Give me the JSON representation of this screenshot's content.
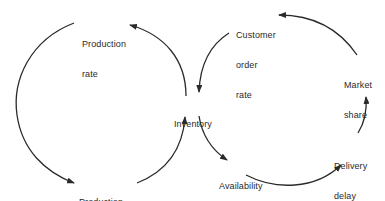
{
  "diagram": {
    "type": "causal-loop",
    "colors": {
      "line": "#2a2a2a",
      "text": "#2a2a2a",
      "background": "#ffffff"
    },
    "nodes": {
      "production_rate": {
        "lines": [
          "Production",
          "rate"
        ]
      },
      "production_completions": {
        "lines": [
          "Production",
          "completions"
        ]
      },
      "inventory": {
        "lines": [
          "Inventory"
        ]
      },
      "customer_order_rate": {
        "lines": [
          "Customer",
          "order",
          "rate"
        ]
      },
      "market_share": {
        "lines": [
          "Market",
          "share"
        ]
      },
      "delivery_delay": {
        "lines": [
          "Delivery",
          "delay"
        ]
      },
      "availability": {
        "lines": [
          "Availability"
        ]
      }
    },
    "edges": [
      {
        "from": "Inventory",
        "to": "Production rate"
      },
      {
        "from": "Production rate",
        "to": "Production completions"
      },
      {
        "from": "Production completions",
        "to": "Inventory"
      },
      {
        "from": "Inventory",
        "to": "Availability"
      },
      {
        "from": "Availability",
        "to": "Delivery delay"
      },
      {
        "from": "Delivery delay",
        "to": "Market share"
      },
      {
        "from": "Market share",
        "to": "Customer order rate"
      },
      {
        "from": "Customer order rate",
        "to": "Inventory"
      }
    ]
  }
}
